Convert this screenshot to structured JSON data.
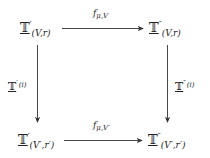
{
  "diagram": {
    "type": "commutative-square",
    "nodes": {
      "top_left": {
        "base": "𝕋",
        "prime": "′",
        "sub": "(V,r)"
      },
      "top_right": {
        "base": "𝕋",
        "prime": "″",
        "sub": "(V,r)"
      },
      "bottom_left": {
        "base": "𝕋",
        "prime": "′",
        "sub": "(V′,r′)"
      },
      "bottom_right": {
        "base": "𝕋",
        "prime": "″",
        "sub": "(V′,r′)"
      }
    },
    "edges": {
      "top": {
        "from": "top_left",
        "to": "top_right",
        "label_f": "f",
        "label_sub": "μ,V"
      },
      "bottom": {
        "from": "bottom_left",
        "to": "bottom_right",
        "label_f": "f",
        "label_sub": "μ,V′"
      },
      "left": {
        "from": "top_left",
        "to": "bottom_left",
        "base": "𝕋",
        "prime": "′",
        "arg": "(i)"
      },
      "right": {
        "from": "top_right",
        "to": "bottom_right",
        "base": "𝕋",
        "prime": "″",
        "arg": "(i)"
      }
    },
    "colors": {
      "stroke": "#333333",
      "background": "#ffffff"
    }
  }
}
